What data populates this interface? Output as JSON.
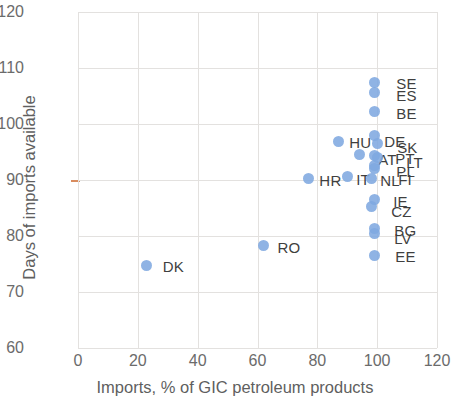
{
  "chart_data": {
    "type": "scatter",
    "title": "",
    "xlabel": "Imports, % of GIC petroleum products",
    "ylabel": "Days of imports available",
    "xlim": [
      0,
      120
    ],
    "ylim": [
      60,
      120
    ],
    "xticks": [
      "0",
      "20",
      "40",
      "60",
      "80",
      "100",
      "120"
    ],
    "yticks": [
      "60",
      "70",
      "80",
      "90",
      "100",
      "110",
      "120"
    ],
    "xtick_step": 20,
    "ytick_step": 10,
    "grid": true,
    "legend": "none",
    "marker_color": "#7fa9e0",
    "gridline_color": "#e3e1df",
    "reference_tick": {
      "axis": "y",
      "value": 90,
      "color": "#d98c5f"
    },
    "points": [
      {
        "label": "SE",
        "x": 99,
        "y": 107.4,
        "label_dx": 22,
        "label_dy": -8
      },
      {
        "label": "ES",
        "x": 99,
        "y": 105.6,
        "label_dx": 22,
        "label_dy": -6
      },
      {
        "label": "BE",
        "x": 99,
        "y": 102.2,
        "label_dx": 22,
        "label_dy": -7
      },
      {
        "label": "HU",
        "x": 87,
        "y": 96.9,
        "label_dx": 11,
        "label_dy": -7
      },
      {
        "label": "DE",
        "x": 99,
        "y": 98.0,
        "label_dx": 10,
        "label_dy": -2
      },
      {
        "label": "SK",
        "x": 100,
        "y": 96.6,
        "label_dx": 20,
        "label_dy": -4
      },
      {
        "label": "AT",
        "x": 94,
        "y": 94.5,
        "label_dx": 19,
        "label_dy": -4
      },
      {
        "label": "PT",
        "x": 99,
        "y": 94.3,
        "label_dx": 21,
        "label_dy": -6
      },
      {
        "label": "LT",
        "x": 100,
        "y": 94.0,
        "label_dx": 29,
        "label_dy": -4
      },
      {
        "label": "PL",
        "x": 99,
        "y": 92.6,
        "label_dx": 22,
        "label_dy": -2
      },
      {
        "label": "FI",
        "x": 99,
        "y": 92.0,
        "label_dx": 24,
        "label_dy": 2
      },
      {
        "label": "HR",
        "x": 77,
        "y": 90.3,
        "label_dx": 11,
        "label_dy": -6
      },
      {
        "label": "IT",
        "x": 90,
        "y": 90.7,
        "label_dx": 9,
        "label_dy": -5
      },
      {
        "label": "NL",
        "x": 98,
        "y": 90.3,
        "label_dx": 9,
        "label_dy": -6
      },
      {
        "label": "IE",
        "x": 99,
        "y": 86.5,
        "label_dx": 19,
        "label_dy": -7
      },
      {
        "label": "CZ",
        "x": 98,
        "y": 85.3,
        "label_dx": 20,
        "label_dy": -3
      },
      {
        "label": "BG",
        "x": 99,
        "y": 81.4,
        "label_dx": 20,
        "label_dy": -6
      },
      {
        "label": "LV",
        "x": 99,
        "y": 80.5,
        "label_dx": 20,
        "label_dy": -3
      },
      {
        "label": "EE",
        "x": 99,
        "y": 76.6,
        "label_dx": 21,
        "label_dy": -7
      },
      {
        "label": "RO",
        "x": 62,
        "y": 78.3,
        "label_dx": 14,
        "label_dy": -7
      },
      {
        "label": "DK",
        "x": 23,
        "y": 74.8,
        "label_dx": 16,
        "label_dy": -7
      }
    ]
  }
}
